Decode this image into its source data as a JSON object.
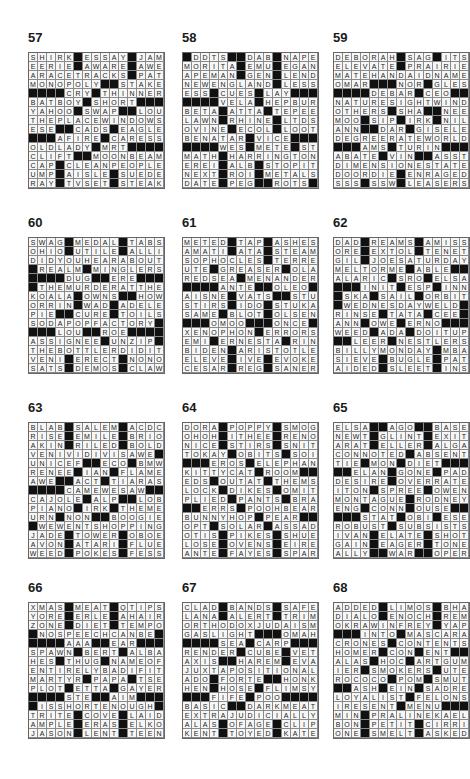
{
  "puzzles": [
    {
      "number": "57",
      "rows": [
        "SHIRK#ESSAY#JAM",
        "EERIE#AWARE#AWE",
        "ARACETRACKS#PAT",
        "MONOPOLY##STAKE",
        "####CRY#THINNER",
        "BATBOY#SHORT###",
        "YAHOO#SWAP##LOU",
        "THEPLACEWINDOWS",
        "ESE##CADS#EAGLE",
        "###AFIRE#CARESS",
        "OLDLADY#MRT####",
        "CLIFT##MOONBEAM",
        "CAP#CLEANPEOPLE",
        "UMP#AISLE#SUEDE",
        "RAY#TVSET#STEAK"
      ]
    },
    {
      "number": "58",
      "rows": [
        "#DDTS##DAB#NAPE",
        "MORITA#EMU#EGAN",
        "APEMAN#GEN#LEND",
        "NEWENGLAND#LESS",
        "ESS#CUES#LAY####",
        "####VELA#HEPBURN",
        "BETA#ATTA#TEPEE",
        "LAWN#RHINE#LTDS",
        "OVINE#ECOL#LOOT",
        "BENATAR#VICE####",
        "####WES#METE#STA",
        "MATH#HARRINGTON",
        "EREI#ALB#STOPIT",
        "NEXT#ROI#METALS",
        "DATE#PEG##ROTS#"
      ]
    },
    {
      "number": "59",
      "rows": [
        "DEBORAH#SAG#ITS",
        "ELEVATE#PRAIRIE",
        "MATEHANDAIDNAME",
        "OMAR###NOR#GLESS",
        "####DEBAR#CEO###",
        "NATURESIGHTWIND",
        "OTHERS#SHA##NEE",
        "MOO#SIP#IRK#NIL",
        "ANN##DAR#GISELE",
        "DEGREERATEWORLD",
        "###AMS#TURIN###",
        "ABATE#VIN##ASST",
        "DIMENSIONESTATE",
        "DOORDIE#ENRAGED",
        "SSS#SSW#LEASERS"
      ]
    },
    {
      "number": "60",
      "rows": [
        "SWAG#MEDAL#TABS",
        "OHIO#UTILE#ALLI",
        "DIDYOUHEARABOUT",
        "#REALM#MINGLERS",
        "####DUG##ERE####",
        "#THEMURDERATTHE",
        "KOALA#OWNS##HOW",
        "ORRIN#WAD#ADELE",
        "PIE##CURE#TOILS",
        "SODAPOPFACTORY#",
        "###LOU##ROE####",
        "ASSIGNEE#UNZIP#",
        "THEBOTTLERDIDIT",
        "VENI#ERECT#NONO",
        "SATS#DEMOS#CLAW"
      ]
    },
    {
      "number": "61",
      "rows": [
        "METED#TAP#ASHES",
        "AMATI#ATA#STEAM",
        "SOPHOCLES#TERRE",
        "UTE#GREASER#OLA",
        "REDSEA#MENANDER",
        "####ANTE##OLEO##",
        "AISNE#VATS##STUB",
        "STIRS#IDO#STUKA",
        "SAME#BLOT#OLSEN",
        "###OMOO###ONCE###",
        "XENOPHON#ERRORS",
        "EMI#ERNESTA#RIN",
        "BIDEN#ARISTOTLE",
        "ELEVE#IVE#EVOKE",
        "CESAR#REG#SANER"
      ]
    },
    {
      "number": "62",
      "rows": [
        "DAD#REAMS#AMISS",
        "ORE#EXTOL#TENET",
        "GIL#JOESATURDAY",
        "MELTORME#ABLE##",
        "ALARIC#SRO#ELSA",
        "###INIT#ESP#INN",
        "#SKA#SAIL#ORBIT",
        "#WEDNESDAYWELD#",
        "RINSE#TATA#CEE#",
        "ANN#OWE#ERNO###",
        "WEED#ADA#DOITUP",
        "##LEER#NESTLERS",
        "BILLYMONDAY#MBA",
        "SIEVE#BUGLE#PAT",
        "AIDED#SLEET#INS"
      ]
    },
    {
      "number": "63",
      "rows": [
        "BLAB#SALEM#ACDC",
        "RISE#EMILE#BRIO",
        "AKIN#RILED#BOLD",
        "VENIVIDIVISAWE#",
        "UNICEF##ECO#BMW",
        "RENEE#IAN#FLAME",
        "AWE##ACT#TIARAS",
        "####CAMEWESAW###",
        "CAJOLE#ALP##LOB",
        "PIANO#IRK#THEME",
        "URN#NON##BOOGIE",
        "#WEWENTSHOPPING",
        "JADE#TOWER#OBOE",
        "AVON#ATARI#FLUE",
        "WEED#POKES#FESS"
      ]
    },
    {
      "number": "64",
      "rows": [
        "DORA#POPPY#SMOG",
        "OHOH#ITHEE#RENO",
        "NICE#STIRS#SNIT",
        "TOKAY#OBITS#SOI",
        "###EROS#ELEPHANT",
        "KITTYCAT#ROOM##",
        "EDS#OUTAT#THEMS",
        "LOCK#DIKES#OMIT",
        "PLIED#PANTS#BRA",
        "##ERRS#POOHBEAR",
        "BUNNYHOP#PEAR##",
        "OPT#SOLAR#ASSAD",
        "OTIS#PIKES#SHUE",
        "LOSE#OVENS#EIRE",
        "ANTE#FAYES#SPAR"
      ]
    },
    {
      "number": "65",
      "rows": [
        "ELSA##AGO##BASE",
        "NEWT#GLINT#EXIT",
        "ARAT#ELLER#ALGA",
        "CONNOTED#ABSENT",
        "TIE#MON#DIET###",
        "##ELAN#GONE#PAD",
        "DESIRE#OVERRATE",
        "ITON#SPREE#OWEN",
        "MONTAGUE#RODNEY",
        "ENG#CONN#OUSE##",
        "###STAT#OBI#ESE",
        "ROBUST#SUBSISTS",
        "IVAN#ELATE#SHOT",
        "GAIN#EAGER#TONE",
        "ALLY##WAR##OPER"
      ]
    },
    {
      "number": "66",
      "rows": [
        "XMAS#MEAT#QTIPS",
        "YORE#ERLE#AHAIR",
        "ZONE#DIET#TEMPO",
        "#NOSPEECHCANBE#",
        "####AAA##EAR####",
        "SPAWN#BERT#ALBA",
        "HES#THUG#NAMEOF",
        "ENTIRELYBADIFIT",
        "MARTYR#PAPA#TSE",
        "PLOT#ETTA#GAYER",
        "####STE##AIM####",
        "#ISSHORTENOUGH#",
        "TRITE#COVE#LAID",
        "AMPLE#ERAS#ELKO",
        "JASON#LENT#TEEN"
      ]
    },
    {
      "number": "67",
      "rows": [
        "CLAD#BANDS#SAFE",
        "LANA#ALERT#TRIM",
        "ORTHODOXJUDAISM",
        "GASLIGHT###OMAHA",
        "####SEA#CARP####",
        "RENDER#CUBE#VET",
        "AXIS##HAREM#EVA",
        "JUXTAPOSITIONAL",
        "ADO#FORTE##HONK",
        "HEN#HOSE#FLIMSY",
        "###FIFE#POO#####",
        "BASIC##DARKMEAT",
        "EXTRAJUDICIALLY",
        "ALAS#OFAGE#CLIP",
        "KENT#TOYED#KATE"
      ]
    },
    {
      "number": "68",
      "rows": [
        "ADDED#LIMOS#BHA",
        "DIALO#ENOCH#REM",
        "OKRAWINFREY#YAP",
        "###INTO#MASCARA",
        "CRONES#CONTENTS",
        "HOMER#CON#ENT##",
        "ALAS#HOC#ARTGUM",
        "IER#SMOKERS#UTE",
        "ROCOCO#POM#SMUT",
        "##ASH#EIN#SADRE",
        "LOYALIST#FELONS",
        "IRESENT#MENU####",
        "MIN#PRALINEKAEL",
        "BON#PETIT#CIRRI",
        "ONE#SMELT#ASKED"
      ]
    }
  ]
}
